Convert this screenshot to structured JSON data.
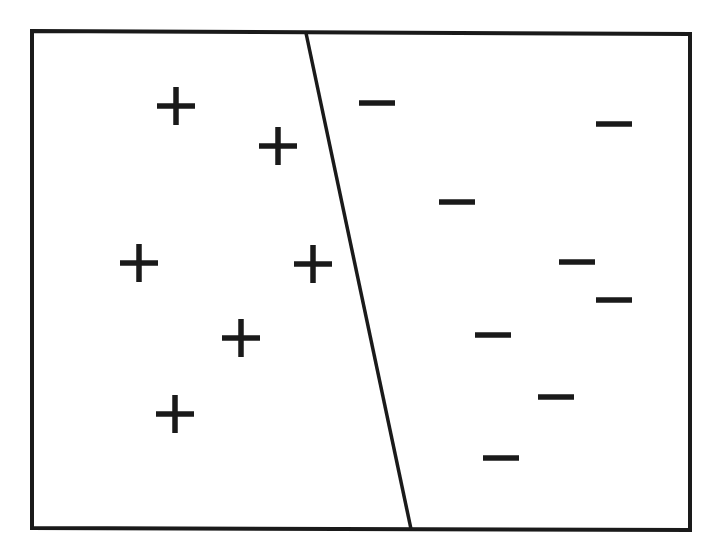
{
  "diagram": {
    "type": "linear-classifier-separation",
    "width": 714,
    "height": 558,
    "colors": {
      "background": "#ffffff",
      "stroke": "#1a1a1a"
    },
    "frame": {
      "points": [
        [
          32,
          31
        ],
        [
          690,
          34
        ],
        [
          690,
          530
        ],
        [
          32,
          528
        ]
      ],
      "stroke_width": 4
    },
    "decision_boundary": {
      "x1": 306,
      "y1": 33,
      "x2": 411,
      "y2": 529,
      "stroke_width": 3.5
    },
    "marker_style": {
      "plus_size": 38,
      "minus_width": 36,
      "stroke_width": 5.5
    },
    "classes": [
      {
        "label": "positive",
        "symbol": "+",
        "region": "left",
        "points": [
          [
            176,
            106
          ],
          [
            278,
            146
          ],
          [
            139,
            263
          ],
          [
            313,
            264
          ],
          [
            241,
            338
          ],
          [
            175,
            414
          ]
        ]
      },
      {
        "label": "negative",
        "symbol": "−",
        "region": "right",
        "points": [
          [
            377,
            103
          ],
          [
            614,
            124
          ],
          [
            457,
            202
          ],
          [
            577,
            262
          ],
          [
            614,
            300
          ],
          [
            493,
            335
          ],
          [
            556,
            397
          ],
          [
            501,
            458
          ]
        ]
      }
    ]
  }
}
